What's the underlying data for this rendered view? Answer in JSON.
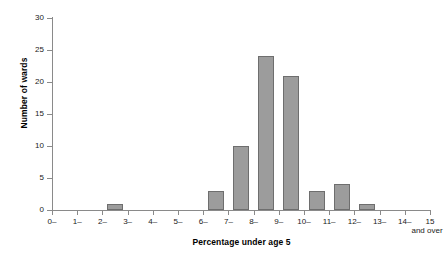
{
  "chart_data": {
    "type": "bar",
    "title": "",
    "subtitle": "",
    "xlabel": "Percentage under age 5",
    "ylabel": "Number of wards",
    "categories": [
      "0–",
      "1–",
      "2–",
      "3–",
      "4–",
      "5–",
      "6–",
      "7–",
      "8–",
      "9–",
      "10–",
      "11–",
      "12–",
      "13–",
      "14–"
    ],
    "values": [
      0,
      0,
      1,
      0,
      0,
      0,
      3,
      10,
      24,
      21,
      3,
      4,
      1,
      0,
      0
    ],
    "x_tick_labels": [
      "0–",
      "1–",
      "2–",
      "3–",
      "4–",
      "5–",
      "6–",
      "7–",
      "8–",
      "9–",
      "10–",
      "11–",
      "12–",
      "13–",
      "14–",
      "15"
    ],
    "x_last_tick_sublabel": "and over",
    "y_tick_labels": [
      "0",
      "5",
      "10",
      "15",
      "20",
      "25",
      "30"
    ],
    "y_tick_values": [
      0,
      5,
      10,
      15,
      20,
      25,
      30
    ],
    "ylim": [
      0,
      30
    ],
    "grid": false,
    "legend": "none",
    "bar_color": "#9c9c9c",
    "bar_border_color": "#6e6e6e",
    "axis_color": "#8a8a8a"
  }
}
